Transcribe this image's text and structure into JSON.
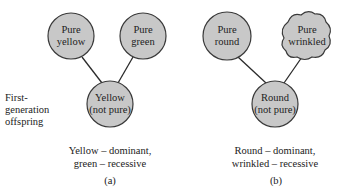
{
  "side_label": {
    "line1": "First-",
    "line2": "generation",
    "line3": "offspring"
  },
  "panel_a": {
    "parent_left": {
      "line1": "Pure",
      "line2": "yellow"
    },
    "parent_right": {
      "line1": "Pure",
      "line2": "green"
    },
    "offspring": {
      "line1": "Yellow",
      "line2": "(not pure)"
    },
    "caption_line1": "Yellow – dominant,",
    "caption_line2": "green – recessive",
    "panel_label": "(a)"
  },
  "panel_b": {
    "parent_left": {
      "line1": "Pure",
      "line2": "round"
    },
    "parent_right": {
      "line1": "Pure",
      "line2": "wrinkled"
    },
    "offspring": {
      "line1": "Round",
      "line2": "(not pure)"
    },
    "caption_line1": "Round – dominant,",
    "caption_line2": "wrinkled – recessive",
    "panel_label": "(b)"
  },
  "colors": {
    "node_fill": "#c8c8c8",
    "node_stroke": "#3a3a3a",
    "line": "#2a2a2a"
  }
}
